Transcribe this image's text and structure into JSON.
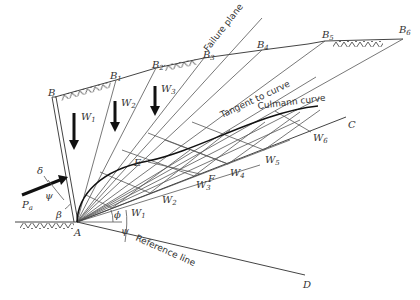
{
  "figure": {
    "points": {
      "A": "A",
      "B": "B",
      "C": "C",
      "D": "D",
      "E": "E",
      "F": "F",
      "B1": "B",
      "B2": "B",
      "B3": "B",
      "B4": "B",
      "B5": "B",
      "B6": "B",
      "B1_sub": "1",
      "B2_sub": "2",
      "B3_sub": "3",
      "B4_sub": "4",
      "B5_sub": "5",
      "B6_sub": "6"
    },
    "weights": [
      {
        "label": "W",
        "sub": "1"
      },
      {
        "label": "W",
        "sub": "2"
      },
      {
        "label": "W",
        "sub": "3"
      },
      {
        "label": "W",
        "sub": "4"
      },
      {
        "label": "W",
        "sub": "5"
      },
      {
        "label": "W",
        "sub": "6"
      }
    ],
    "annotations": {
      "failure_plane": "Failure plane",
      "tangent": "Tangent to curve",
      "culmann": "Culmann curve",
      "reference": "Reference line"
    },
    "symbols": {
      "delta": "δ",
      "psi": "ψ",
      "beta": "β",
      "phi": "ϕ",
      "Pa": "P",
      "Pa_sub": "a"
    }
  }
}
